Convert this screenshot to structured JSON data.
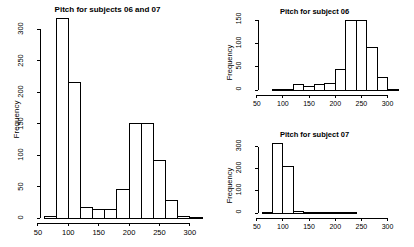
{
  "figure": {
    "background_color": "#ffffff",
    "foreground_color": "#000000",
    "panel_count": 3
  },
  "chart_data": [
    {
      "id": "combined",
      "type": "bar",
      "title": "Pitch for subjects 06 and 07",
      "xlabel": "",
      "ylabel": "Frequency",
      "xlim": [
        60,
        320
      ],
      "ylim": [
        0,
        318
      ],
      "xticks": [
        50,
        100,
        150,
        200,
        250,
        300
      ],
      "yticks": [
        0,
        50,
        100,
        150,
        200,
        250,
        300
      ],
      "grid": false,
      "legend": "none",
      "bin_width": 20,
      "bin_edges": [
        60,
        80,
        100,
        120,
        140,
        160,
        180,
        200,
        220,
        240,
        260,
        280,
        300,
        320
      ],
      "categories": [
        "60-80",
        "80-100",
        "100-120",
        "120-140",
        "140-160",
        "160-180",
        "180-200",
        "200-220",
        "220-240",
        "240-260",
        "260-280",
        "280-300",
        "300-320"
      ],
      "values": [
        2,
        318,
        215,
        16,
        13,
        13,
        46,
        151,
        151,
        91,
        28,
        2,
        1
      ]
    },
    {
      "id": "subject06",
      "type": "bar",
      "title": "Pitch for subject 06",
      "xlabel": "",
      "ylabel": "Frequency",
      "xlim": [
        60,
        320
      ],
      "ylim": [
        0,
        151
      ],
      "xticks": [
        50,
        100,
        150,
        200,
        250,
        300
      ],
      "yticks": [
        0,
        50,
        100,
        150
      ],
      "grid": false,
      "legend": "none",
      "bin_width": 20,
      "bin_edges": [
        60,
        80,
        100,
        120,
        140,
        160,
        180,
        200,
        220,
        240,
        260,
        280,
        300,
        320
      ],
      "categories": [
        "60-80",
        "80-100",
        "100-120",
        "120-140",
        "140-160",
        "160-180",
        "180-200",
        "200-220",
        "220-240",
        "240-260",
        "260-280",
        "280-300",
        "300-320"
      ],
      "values": [
        0,
        1,
        2,
        12,
        8,
        11,
        13,
        44,
        151,
        151,
        91,
        28,
        2
      ]
    },
    {
      "id": "subject07",
      "type": "bar",
      "title": "Pitch for subject 07",
      "xlabel": "",
      "ylabel": "Frequency",
      "xlim": [
        60,
        320
      ],
      "ylim": [
        0,
        318
      ],
      "xticks": [
        50,
        100,
        150,
        200,
        250,
        300
      ],
      "yticks": [
        0,
        100,
        200,
        300
      ],
      "grid": false,
      "legend": "none",
      "bin_width": 20,
      "bin_edges": [
        60,
        80,
        100,
        120,
        140,
        160,
        180,
        200,
        220,
        240,
        260,
        280,
        300,
        320
      ],
      "categories": [
        "60-80",
        "80-100",
        "100-120",
        "120-140",
        "140-160",
        "160-180",
        "180-200",
        "200-220",
        "220-240",
        "240-260",
        "260-280",
        "280-300",
        "300-320"
      ],
      "values": [
        2,
        317,
        209,
        6,
        3,
        2,
        2,
        1,
        1,
        0,
        0,
        0,
        0
      ]
    }
  ]
}
